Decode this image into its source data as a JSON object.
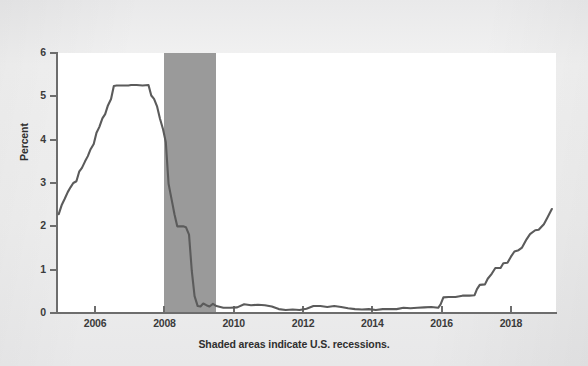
{
  "figure": {
    "background_color": "#efefef",
    "panel_color": "#ffffff",
    "axis_color": "#6d6d6d",
    "line_color": "#5b5b5b",
    "recession_color": "#9a9a9a",
    "footnote": "Shaded areas indicate U.S. recessions."
  },
  "chart_data": {
    "type": "line",
    "title": "",
    "subtitle": "",
    "xlabel": "",
    "ylabel": "Percent",
    "xlim": [
      2004.9,
      2019.3
    ],
    "ylim": [
      0,
      6
    ],
    "grid": false,
    "legend": "none",
    "annotations": [
      "Shaded areas indicate U.S. recessions."
    ],
    "xticks": [
      2006,
      2008,
      2010,
      2012,
      2014,
      2016,
      2018
    ],
    "xtick_labels": [
      "2006",
      "2008",
      "2010",
      "2012",
      "2014",
      "2016",
      "2018"
    ],
    "yticks": [
      0,
      1,
      2,
      3,
      4,
      5,
      6
    ],
    "ytick_labels": [
      "0",
      "1",
      "2",
      "3",
      "4",
      "5",
      "6"
    ],
    "shaded_regions": [
      {
        "label": "U.S. recession",
        "x_start": 2008.0,
        "x_end": 2009.5,
        "color": "#9a9a9a"
      }
    ],
    "series": [
      {
        "name": "Effective Federal Funds Rate",
        "color": "#5b5b5b",
        "x": [
          2004.95,
          2005.04,
          2005.12,
          2005.21,
          2005.29,
          2005.37,
          2005.46,
          2005.54,
          2005.62,
          2005.71,
          2005.79,
          2005.87,
          2005.96,
          2006.04,
          2006.12,
          2006.21,
          2006.29,
          2006.37,
          2006.46,
          2006.54,
          2006.62,
          2006.71,
          2006.79,
          2006.87,
          2006.96,
          2007.04,
          2007.2,
          2007.37,
          2007.54,
          2007.62,
          2007.7,
          2007.79,
          2007.87,
          2007.96,
          2008.04,
          2008.12,
          2008.21,
          2008.29,
          2008.37,
          2008.46,
          2008.54,
          2008.62,
          2008.71,
          2008.79,
          2008.87,
          2008.96,
          2009.04,
          2009.12,
          2009.21,
          2009.3,
          2009.4,
          2009.5,
          2009.7,
          2009.9,
          2010.1,
          2010.3,
          2010.5,
          2010.7,
          2010.9,
          2011.1,
          2011.3,
          2011.5,
          2011.7,
          2011.9,
          2012.1,
          2012.3,
          2012.5,
          2012.7,
          2012.9,
          2013.1,
          2013.3,
          2013.5,
          2013.7,
          2013.9,
          2014.1,
          2014.3,
          2014.5,
          2014.7,
          2014.9,
          2015.1,
          2015.3,
          2015.5,
          2015.7,
          2015.9,
          2015.97,
          2016.05,
          2016.2,
          2016.4,
          2016.6,
          2016.8,
          2016.95,
          2017.02,
          2017.1,
          2017.25,
          2017.33,
          2017.45,
          2017.55,
          2017.7,
          2017.78,
          2017.9,
          2018.0,
          2018.1,
          2018.22,
          2018.32,
          2018.45,
          2018.55,
          2018.7,
          2018.8,
          2018.95,
          2019.05,
          2019.18
        ],
        "y": [
          2.28,
          2.5,
          2.63,
          2.79,
          2.9,
          3.0,
          3.04,
          3.26,
          3.35,
          3.5,
          3.62,
          3.78,
          3.9,
          4.16,
          4.29,
          4.49,
          4.59,
          4.79,
          4.94,
          5.24,
          5.25,
          5.25,
          5.25,
          5.25,
          5.25,
          5.26,
          5.26,
          5.25,
          5.26,
          5.02,
          4.94,
          4.76,
          4.49,
          4.24,
          3.94,
          2.98,
          2.61,
          2.28,
          2.0,
          2.0,
          2.0,
          1.98,
          1.81,
          0.97,
          0.39,
          0.16,
          0.15,
          0.22,
          0.18,
          0.15,
          0.21,
          0.16,
          0.12,
          0.12,
          0.13,
          0.2,
          0.18,
          0.19,
          0.18,
          0.15,
          0.09,
          0.07,
          0.08,
          0.07,
          0.1,
          0.16,
          0.16,
          0.14,
          0.16,
          0.14,
          0.11,
          0.09,
          0.08,
          0.09,
          0.07,
          0.09,
          0.09,
          0.09,
          0.12,
          0.11,
          0.12,
          0.13,
          0.14,
          0.12,
          0.2,
          0.36,
          0.37,
          0.37,
          0.4,
          0.4,
          0.41,
          0.55,
          0.65,
          0.66,
          0.79,
          0.91,
          1.04,
          1.04,
          1.15,
          1.16,
          1.3,
          1.42,
          1.45,
          1.51,
          1.7,
          1.82,
          1.91,
          1.92,
          2.05,
          2.2,
          2.4
        ]
      }
    ]
  },
  "axis": {
    "y_label": "Percent"
  }
}
